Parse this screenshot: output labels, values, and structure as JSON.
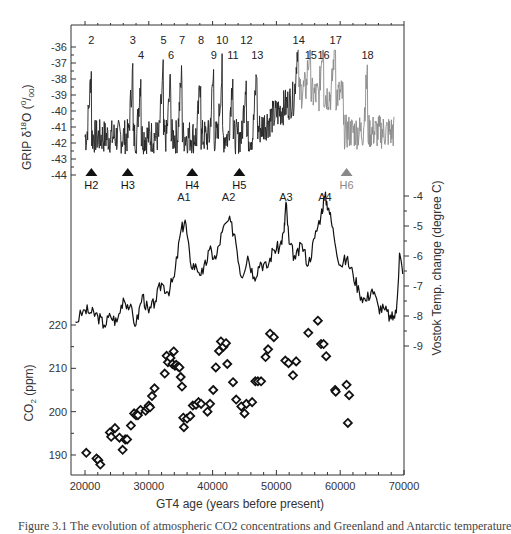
{
  "chart_data": [
    {
      "type": "line",
      "panel": "top",
      "ylabel": "GRIP δ18O (‰)",
      "ylim": [
        -44,
        -36
      ],
      "yticks": [
        -36,
        -37,
        -38,
        -39,
        -40,
        -41,
        -42,
        -43,
        -44
      ],
      "xlim": [
        18000,
        70000
      ],
      "dansgaard_oeschger_events": [
        {
          "label": "2",
          "x": 21000
        },
        {
          "label": "3",
          "x": 27500
        },
        {
          "label": "4",
          "x": 28800
        },
        {
          "label": "5",
          "x": 32300
        },
        {
          "label": "6",
          "x": 33500
        },
        {
          "label": "7",
          "x": 35200
        },
        {
          "label": "8",
          "x": 38200
        },
        {
          "label": "9",
          "x": 40200
        },
        {
          "label": "10",
          "x": 41500
        },
        {
          "label": "11",
          "x": 43200
        },
        {
          "label": "12",
          "x": 45300
        },
        {
          "label": "13",
          "x": 47000
        },
        {
          "label": "14",
          "x": 53500
        },
        {
          "label": "15",
          "x": 55400
        },
        {
          "label": "16",
          "x": 57400
        },
        {
          "label": "17",
          "x": 59300
        },
        {
          "label": "18",
          "x": 64300
        }
      ],
      "heinrich_events": [
        {
          "label": "H2",
          "x": 21000,
          "color": "#111111"
        },
        {
          "label": "H3",
          "x": 26700,
          "color": "#111111"
        },
        {
          "label": "H4",
          "x": 36800,
          "color": "#111111"
        },
        {
          "label": "H5",
          "x": 44200,
          "color": "#111111"
        },
        {
          "label": "H6",
          "x": 61000,
          "color": "#888888"
        }
      ],
      "note": "GRIP curve drawn black to ~50000 yr, grey beyond"
    },
    {
      "type": "line",
      "panel": "middle",
      "ylabel": "Vostok Temp. change  (degree C)",
      "ylim": [
        -9,
        -4
      ],
      "yticks": [
        -4,
        -5,
        -6,
        -7,
        -8,
        -9
      ],
      "antarctic_events": [
        {
          "label": "A1",
          "x": 35500
        },
        {
          "label": "A2",
          "x": 42500
        },
        {
          "label": "A3",
          "x": 51500
        },
        {
          "label": "A4",
          "x": 57600
        }
      ],
      "x": [
        18500,
        20000,
        21000,
        22000,
        23000,
        24000,
        25000,
        26000,
        27000,
        28000,
        29000,
        30000,
        31000,
        32000,
        33000,
        34000,
        35000,
        35700,
        36500,
        37500,
        38500,
        39500,
        40500,
        41500,
        42500,
        43500,
        44500,
        45500,
        46500,
        47500,
        48500,
        49500,
        50500,
        51200,
        51500,
        52000,
        53000,
        54000,
        55000,
        56000,
        57000,
        57600,
        58200,
        59000,
        60000,
        61000,
        62000,
        63000,
        64000,
        65000,
        66000,
        67000,
        68000,
        68800,
        69300,
        69800
      ],
      "values": [
        -8.2,
        -7.8,
        -7.9,
        -8.0,
        -8.3,
        -8.0,
        -8.2,
        -7.4,
        -7.7,
        -8.3,
        -7.3,
        -7.9,
        -7.5,
        -6.9,
        -7.2,
        -6.7,
        -5.2,
        -4.8,
        -6.2,
        -6.4,
        -6.6,
        -5.8,
        -6.1,
        -5.2,
        -4.8,
        -5.3,
        -6.7,
        -6.0,
        -6.7,
        -6.2,
        -6.4,
        -5.8,
        -5.7,
        -5.2,
        -4.2,
        -5.6,
        -6.1,
        -5.6,
        -6.3,
        -5.4,
        -4.6,
        -4.0,
        -4.4,
        -5.3,
        -6.3,
        -6.1,
        -6.6,
        -7.2,
        -7.5,
        -7.1,
        -7.7,
        -7.8,
        -8.1,
        -7.9,
        -5.9,
        -6.6
      ]
    },
    {
      "type": "scatter",
      "panel": "bottom",
      "title": "",
      "xlabel": "GT4 age  (years before present)",
      "ylabel": "CO2 (ppm)",
      "ylim": [
        185,
        222
      ],
      "yticks": [
        190,
        200,
        210,
        220
      ],
      "xticks": [
        20000,
        30000,
        40000,
        50000,
        60000,
        70000
      ],
      "xlim": [
        18000,
        70000
      ],
      "points": [
        [
          20200,
          190.5
        ],
        [
          21800,
          189.2
        ],
        [
          22100,
          188.8
        ],
        [
          22400,
          187.8
        ],
        [
          23900,
          195.2
        ],
        [
          24100,
          194.2
        ],
        [
          24700,
          196.2
        ],
        [
          25400,
          194.0
        ],
        [
          25900,
          191.2
        ],
        [
          26300,
          193.6
        ],
        [
          26600,
          193.6
        ],
        [
          27200,
          196.8
        ],
        [
          27700,
          199.6
        ],
        [
          28000,
          199.2
        ],
        [
          28300,
          199.2
        ],
        [
          28700,
          200.4
        ],
        [
          29500,
          200.2
        ],
        [
          29800,
          200.8
        ],
        [
          30000,
          201.4
        ],
        [
          30200,
          201.0
        ],
        [
          30500,
          203.6
        ],
        [
          30900,
          205.4
        ],
        [
          32500,
          208.8
        ],
        [
          32800,
          212.9
        ],
        [
          33000,
          211.4
        ],
        [
          33400,
          212.4
        ],
        [
          33700,
          211.0
        ],
        [
          33900,
          213.9
        ],
        [
          34100,
          210.6
        ],
        [
          34300,
          210.8
        ],
        [
          34600,
          210.4
        ],
        [
          34800,
          210.2
        ],
        [
          35000,
          208.0
        ],
        [
          35200,
          205.8
        ],
        [
          35400,
          198.6
        ],
        [
          35500,
          196.4
        ],
        [
          36000,
          198.4
        ],
        [
          36500,
          199.0
        ],
        [
          36900,
          201.4
        ],
        [
          37400,
          201.6
        ],
        [
          37800,
          202.2
        ],
        [
          38200,
          201.8
        ],
        [
          39200,
          200.0
        ],
        [
          39600,
          201.8
        ],
        [
          40100,
          205.0
        ],
        [
          40500,
          210.2
        ],
        [
          41000,
          214.0
        ],
        [
          41300,
          216.2
        ],
        [
          41700,
          215.0
        ],
        [
          42100,
          215.8
        ],
        [
          42300,
          211.0
        ],
        [
          43200,
          206.8
        ],
        [
          43700,
          202.8
        ],
        [
          44500,
          201.2
        ],
        [
          45000,
          199.6
        ],
        [
          45300,
          201.8
        ],
        [
          46200,
          202.2
        ],
        [
          46700,
          207.0
        ],
        [
          47100,
          207.0
        ],
        [
          47600,
          207.0
        ],
        [
          48300,
          212.6
        ],
        [
          48700,
          214.4
        ],
        [
          49000,
          218.0
        ],
        [
          49600,
          217.2
        ],
        [
          51400,
          211.8
        ],
        [
          51900,
          211.2
        ],
        [
          52600,
          208.4
        ],
        [
          53100,
          211.6
        ],
        [
          55000,
          218.2
        ],
        [
          56500,
          221.0
        ],
        [
          57000,
          215.6
        ],
        [
          57400,
          215.6
        ],
        [
          57800,
          212.8
        ],
        [
          59200,
          205.0
        ],
        [
          59300,
          204.6
        ],
        [
          61000,
          206.2
        ],
        [
          61200,
          197.4
        ],
        [
          61400,
          203.8
        ]
      ]
    }
  ],
  "axes": {
    "grip": {
      "title_prefix": "GRIP δ",
      "title_sup": "18",
      "title_suffix": "O (",
      "title_unit_sup": "0",
      "title_unit": "/",
      "title_unit_sub": "00",
      "title_close": ")",
      "ticks": [
        "-36",
        "-37",
        "-38",
        "-39",
        "-40",
        "-41",
        "-42",
        "-43",
        "-44"
      ]
    },
    "vostok": {
      "title": "Vostok Temp. change  (degree C)",
      "ticks": [
        "-4",
        "-5",
        "-6",
        "-7",
        "-8",
        "-9"
      ]
    },
    "co2": {
      "title_prefix": "CO",
      "title_sub": "2",
      "title_suffix": " (ppm)",
      "ticks": [
        "220",
        "210",
        "200",
        "190"
      ]
    },
    "x": {
      "title": "GT4 age  (years before present)",
      "ticks": [
        "20000",
        "30000",
        "40000",
        "50000",
        "60000",
        "70000"
      ]
    }
  },
  "caption": "Figure 3.1  The evolution of atmospheric CO2 concentrations and Greenland and Antarctic temperature"
}
